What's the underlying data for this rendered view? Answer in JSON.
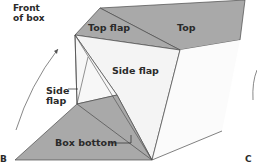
{
  "labels": {
    "front_of_box_line1": "Front",
    "front_of_box_line2": "of box",
    "top_flap": "Top flap",
    "top": "Top",
    "side_flap_right": "Side flap",
    "side_flap_left_line1": "Side",
    "side_flap_left_line2": "flap",
    "box_bottom": "Box bottom",
    "corner_b": "B",
    "corner_c": "C"
  },
  "colors": {
    "gray_panel": "#a9a9a9",
    "white_panel": "#f4f4f4",
    "line": "#3a3a3a",
    "text": "#2a2a2a"
  }
}
